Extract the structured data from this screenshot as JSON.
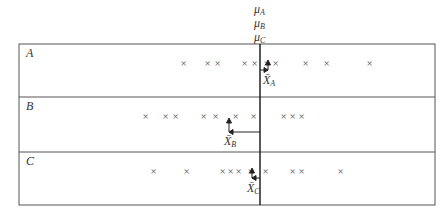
{
  "diagram": {
    "mu_labels": [
      "μA",
      "μB",
      "μC"
    ],
    "population_mean_x": 260,
    "rows": [
      {
        "label": "A",
        "sample_mean_label": "X̄A",
        "sample_mean_x": 268,
        "marks_x": [
          184,
          208,
          218,
          245,
          255,
          267,
          276,
          306,
          327,
          370
        ]
      },
      {
        "label": "B",
        "sample_mean_label": "X̄B",
        "sample_mean_x": 229,
        "marks_x": [
          146,
          166,
          176,
          204,
          216,
          236,
          254,
          284,
          293,
          302
        ]
      },
      {
        "label": "C",
        "sample_mean_label": "X̄C",
        "sample_mean_x": 252,
        "marks_x": [
          154,
          187,
          223,
          231,
          239,
          251,
          266,
          293,
          302,
          341
        ]
      }
    ],
    "colors": {
      "line": "#222222",
      "border": "#555555",
      "mark": "#555555"
    }
  }
}
